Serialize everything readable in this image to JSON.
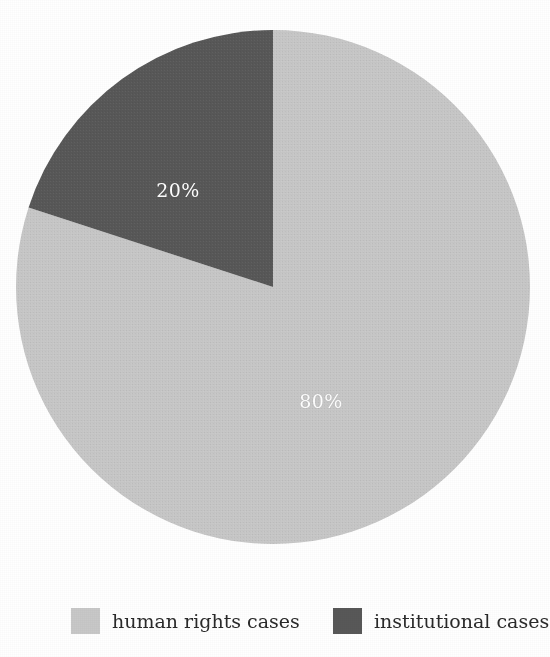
{
  "chart_data": {
    "type": "pie",
    "title": "",
    "subtitle": "",
    "xlabel": "",
    "ylabel": "",
    "grid": false,
    "legend_position": "bottom",
    "start_angle_deg": 90,
    "direction": "clockwise",
    "units": "percent",
    "categories": [
      "human rights cases",
      "institutional cases"
    ],
    "values": [
      80,
      20
    ],
    "data_labels": [
      "80%",
      "20%"
    ],
    "colors": [
      "#c8c8c8",
      "#585858"
    ],
    "label_colors": [
      "#ffffff",
      "#ffffff"
    ],
    "slices": [
      {
        "name": "human rights cases",
        "value": 80,
        "label": "80%",
        "color": "#c8c8c8",
        "start_deg": 0,
        "sweep_deg": 288
      },
      {
        "name": "institutional cases",
        "value": 20,
        "label": "20%",
        "color": "#585858",
        "start_deg": 288,
        "sweep_deg": 72
      }
    ]
  },
  "figure": {
    "background": "#ffffff",
    "geometry": {
      "center_x": 273,
      "center_y": 287,
      "radius": 257
    }
  },
  "labels": {
    "human_percent": "80%",
    "institutional_percent": "20%"
  },
  "legend": {
    "items": [
      {
        "label": "human rights cases",
        "color": "#c8c8c8",
        "swatch_name": "legend-swatch-human-rights"
      },
      {
        "label": "institutional cases",
        "color": "#585858",
        "swatch_name": "legend-swatch-institutional"
      }
    ]
  }
}
